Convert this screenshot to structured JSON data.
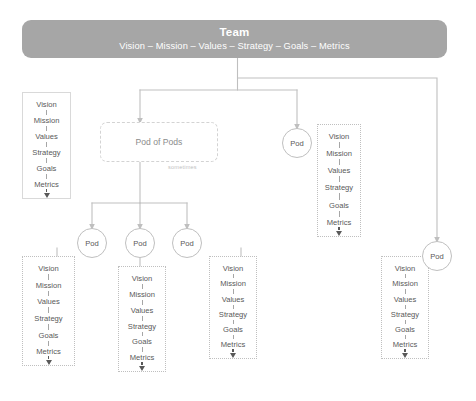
{
  "header": {
    "title": "Team",
    "subtitle": "Vision – Mission – Values – Strategy – Goals – Metrics",
    "bar_color": "#a6a6a6",
    "text_color": "#ffffff"
  },
  "labels": {
    "pod": "Pod",
    "pod_of_pods": "Pod of Pods",
    "sometimes": "sometimes"
  },
  "value_list": [
    "Vision",
    "Mission",
    "Values",
    "Strategy",
    "Goals",
    "Metrics"
  ],
  "boxes": [
    {
      "id": "box-team-left",
      "style": "solid",
      "list": [
        "Vision",
        "Mission",
        "Values",
        "Strategy",
        "Goals",
        "Metrics"
      ]
    },
    {
      "id": "box-pod-right-top",
      "style": "dotted",
      "list": [
        "Vision",
        "Mission",
        "Values",
        "Strategy",
        "Goals",
        "Metrics"
      ]
    },
    {
      "id": "box-pod-1",
      "style": "dotted",
      "list": [
        "Vision",
        "Mission",
        "Values",
        "Strategy",
        "Goals",
        "Metrics"
      ]
    },
    {
      "id": "box-pod-2",
      "style": "dotted",
      "list": [
        "Vision",
        "Mission",
        "Values",
        "Strategy",
        "Goals",
        "Metrics"
      ]
    },
    {
      "id": "box-pod-3",
      "style": "dotted",
      "list": [
        "Vision",
        "Mission",
        "Values",
        "Strategy",
        "Goals",
        "Metrics"
      ]
    },
    {
      "id": "box-pod-far-right",
      "style": "dotted",
      "list": [
        "Vision",
        "Mission",
        "Values",
        "Strategy",
        "Goals",
        "Metrics"
      ]
    }
  ],
  "pods": [
    {
      "id": "pod-right-top",
      "label": "Pod"
    },
    {
      "id": "pod-1",
      "label": "Pod"
    },
    {
      "id": "pod-2",
      "label": "Pod"
    },
    {
      "id": "pod-3",
      "label": "Pod"
    },
    {
      "id": "pod-far-right",
      "label": "Pod"
    }
  ],
  "colors": {
    "connector": "#bfbfbf",
    "box_border_solid": "#d9d9d9",
    "box_border_dotted": "#bfbfbf",
    "text": "#595959",
    "muted_text": "#8c8c8c",
    "background": "#ffffff"
  }
}
